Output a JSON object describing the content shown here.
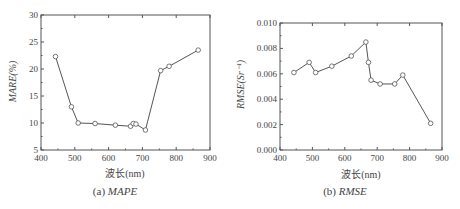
{
  "chart_data": [
    {
      "type": "line",
      "title": "",
      "caption_prefix": "(a) ",
      "caption_name": "MAPE",
      "xlabel": "波长(nm)",
      "ylabel": "MARE(%)",
      "xlim": [
        400,
        900
      ],
      "ylim": [
        5,
        30
      ],
      "xticks": [
        400,
        500,
        600,
        700,
        800,
        900
      ],
      "yticks": [
        5,
        10,
        15,
        20,
        25,
        30
      ],
      "grid": false,
      "legend": null,
      "marker": "open-circle",
      "series": [
        {
          "name": "MAPE",
          "x": [
            443,
            490,
            510,
            560,
            620,
            665,
            673,
            681,
            709,
            754,
            779,
            865
          ],
          "y": [
            22.3,
            13.0,
            10.0,
            9.9,
            9.6,
            9.4,
            9.9,
            9.8,
            8.7,
            19.7,
            20.5,
            23.5
          ]
        }
      ]
    },
    {
      "type": "line",
      "title": "",
      "caption_prefix": "(b) ",
      "caption_name": "RMSE",
      "xlabel": "波长(nm)",
      "ylabel": "RMSE(Sr⁻¹)",
      "xlim": [
        400,
        900
      ],
      "ylim": [
        0.0,
        0.01
      ],
      "xticks": [
        400,
        500,
        600,
        700,
        800,
        900
      ],
      "yticks": [
        "0.000",
        "0.002",
        "0.004",
        "0.006",
        "0.008",
        "0.010"
      ],
      "grid": false,
      "legend": null,
      "marker": "open-circle",
      "series": [
        {
          "name": "RMSE",
          "x": [
            443,
            490,
            510,
            560,
            620,
            665,
            673,
            681,
            709,
            754,
            779,
            865
          ],
          "y": [
            0.0061,
            0.0069,
            0.0061,
            0.0066,
            0.0074,
            0.0085,
            0.0069,
            0.0055,
            0.0052,
            0.0052,
            0.0059,
            0.0021
          ]
        }
      ]
    }
  ]
}
